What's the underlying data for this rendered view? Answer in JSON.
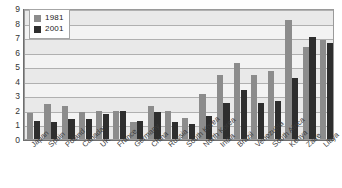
{
  "chart_data": {
    "type": "bar",
    "title": "",
    "subtitle": "",
    "xlabel": "",
    "ylabel": "",
    "ylim": [
      0,
      9
    ],
    "yticks": [
      0,
      1,
      2,
      3,
      4,
      5,
      6,
      7,
      8,
      9
    ],
    "grid": true,
    "legend_position": "top-left",
    "categories": [
      "Japan",
      "Spain",
      "Poland",
      "Canada",
      "UK",
      "France",
      "Germany",
      "China",
      "Russia",
      "South Korea",
      "North Korea",
      "India",
      "Brazil",
      "Venezuela",
      "South Africa",
      "Kenya",
      "Zaire",
      "Libya"
    ],
    "series": [
      {
        "name": "1981",
        "color": "#8c8c8c",
        "values": [
          1.8,
          2.4,
          2.25,
          1.85,
          1.9,
          1.9,
          1.2,
          2.3,
          1.95,
          1.45,
          3.1,
          4.4,
          5.25,
          4.4,
          4.7,
          8.2,
          6.3,
          6.8
        ]
      },
      {
        "name": "2001",
        "color": "#2e2e2e",
        "values": [
          1.25,
          1.2,
          1.4,
          1.4,
          1.75,
          1.9,
          1.25,
          1.85,
          1.15,
          1.0,
          1.6,
          2.5,
          3.4,
          2.5,
          2.6,
          4.2,
          7.0,
          6.6
        ]
      }
    ]
  },
  "legend": {
    "items": [
      {
        "label": "1981",
        "color": "#8c8c8c"
      },
      {
        "label": "2001",
        "color": "#2e2e2e"
      }
    ]
  }
}
